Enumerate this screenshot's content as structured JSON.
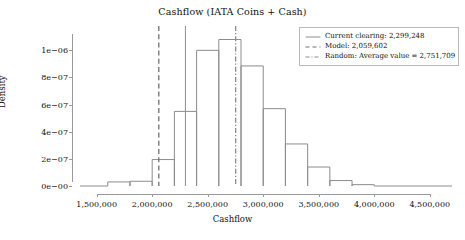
{
  "chart_data": {
    "type": "bar",
    "title": "Cashflow (IATA Coins + Cash)",
    "xlabel": "Cashflow",
    "ylabel": "Density",
    "xlim": [
      1350000,
      4700000
    ],
    "ylim": [
      0,
      1.15e-06
    ],
    "grid": false,
    "legend_position": "upper right",
    "bin_width": 200000,
    "bin_edges": [
      1600000,
      1800000,
      2000000,
      2200000,
      2400000,
      2600000,
      2800000,
      3000000,
      3200000,
      3400000,
      3600000,
      3800000,
      4000000
    ],
    "categories": [
      "1,600,000-1,800,000",
      "1,800,000-2,000,000",
      "2,000,000-2,200,000",
      "2,200,000-2,400,000",
      "2,400,000-2,600,000",
      "2,600,000-2,800,000",
      "2,800,000-3,000,000",
      "3,000,000-3,200,000",
      "3,200,000-3,400,000",
      "3,400,000-3,600,000",
      "3,600,000-3,800,000",
      "3,800,000-4,000,000"
    ],
    "values": [
      3e-08,
      3.5e-08,
      1.95e-07,
      5.5e-07,
      1e-06,
      1.08e-06,
      8.85e-07,
      5.7e-07,
      3.1e-07,
      1.4e-07,
      4e-08,
      1e-08
    ],
    "bar_style": {
      "fill": "none",
      "edge_color": "#8c8c8c",
      "line_width": 1
    },
    "xticks": [
      1500000,
      2000000,
      2500000,
      3000000,
      3500000,
      4000000,
      4500000
    ],
    "xtick_labels": [
      "1,500,000",
      "2,000,000",
      "2,500,000",
      "3,000,000",
      "3,500,000",
      "4,000,000",
      "4,500,000"
    ],
    "yticks": [
      0,
      2e-07,
      4e-07,
      6e-07,
      8e-07,
      1e-06
    ],
    "ytick_labels": [
      "0e−00",
      "2e−07",
      "4e−07",
      "6e−07",
      "8e−07",
      "1e−06"
    ],
    "vlines": [
      {
        "name": "current-clearing",
        "value": 2299248,
        "style": "solid",
        "color": "#8c8c8c"
      },
      {
        "name": "model",
        "value": 2059602,
        "style": "dashed",
        "color": "#707070"
      },
      {
        "name": "random-average",
        "value": 2751709,
        "style": "dashdot",
        "color": "#8c8c8c"
      }
    ],
    "legend": [
      {
        "label": "Current clearing: 2,299,248",
        "style": "solid",
        "color": "#8c8c8c"
      },
      {
        "label": "Model: 2,059,602",
        "style": "dashed",
        "color": "#707070"
      },
      {
        "label": "Random: Average value = 2,751,709",
        "style": "dashdot",
        "color": "#8c8c8c"
      }
    ]
  }
}
